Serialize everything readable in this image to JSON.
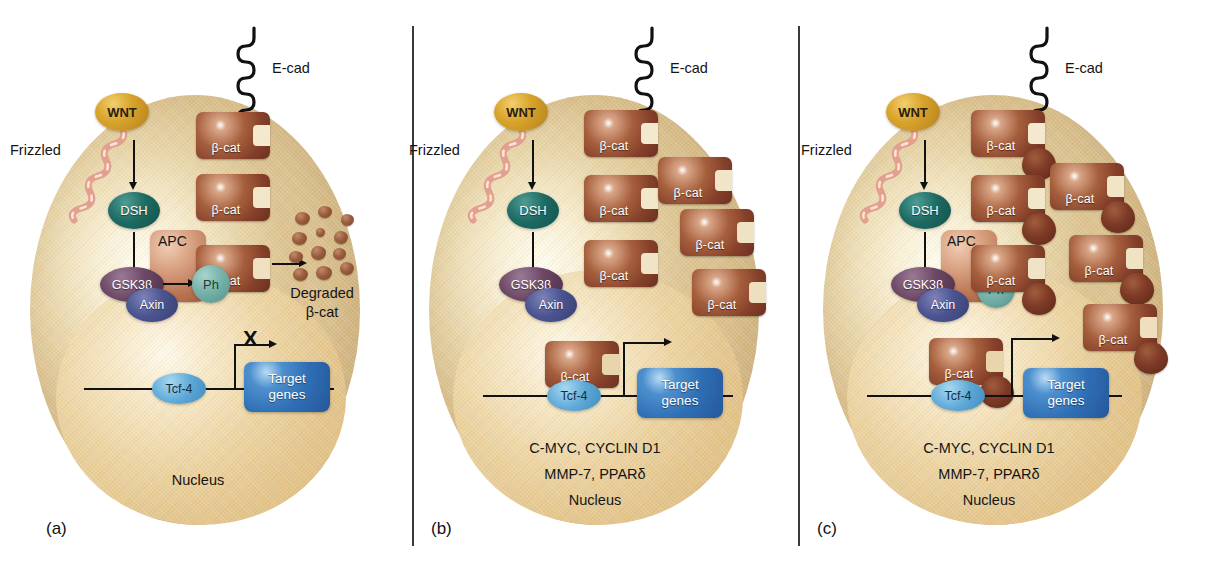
{
  "figure": {
    "panels": [
      {
        "letter": "(a)",
        "labels": {
          "ecad": "E-cad",
          "wnt": "WNT",
          "frizzled": "Frizzled",
          "dsh": "DSH",
          "apc": "APC",
          "gsk3b": "GSK3β",
          "axin": "Axin",
          "ph": "Ph",
          "bcat": "β-cat",
          "degraded_line1": "Degraded",
          "degraded_line2": "β-cat",
          "tcf4": "Tcf-4",
          "target_line1": "Target",
          "target_line2": "genes",
          "nucleus": "Nucleus",
          "blocked": "X"
        },
        "free_bcat_count": 0,
        "membrane_bcat_count": 3,
        "target_genes_active": false,
        "target_gene_list": []
      },
      {
        "letter": "(b)",
        "labels": {
          "ecad": "E-cad",
          "wnt": "WNT",
          "frizzled": "Frizzled",
          "dsh": "DSH",
          "gsk3b": "GSK3β",
          "axin": "Axin",
          "bcat": "β-cat",
          "tcf4": "Tcf-4",
          "target_line1": "Target",
          "target_line2": "genes",
          "nucleus": "Nucleus",
          "genes_line1": "C-MYC, CYCLIN D1",
          "genes_line2": "MMP-7, PPARδ"
        },
        "free_bcat_count": 6,
        "target_genes_active": true,
        "target_gene_list": [
          "C-MYC",
          "CYCLIN D1",
          "MMP-7",
          "PPARδ"
        ]
      },
      {
        "letter": "(c)",
        "labels": {
          "ecad": "E-cad",
          "wnt": "WNT",
          "frizzled": "Frizzled",
          "dsh": "DSH",
          "apc": "APC",
          "gsk3b": "GSK3β",
          "axin": "Axin",
          "ph": "Ph",
          "bcat": "β-cat",
          "tcf4": "Tcf-4",
          "target_line1": "Target",
          "target_line2": "genes",
          "nucleus": "Nucleus",
          "genes_line1": "C-MYC, CYCLIN D1",
          "genes_line2": "MMP-7, PPARδ"
        },
        "free_bcat_count": 7,
        "mutated_bcat": true,
        "target_genes_active": true,
        "target_gene_list": [
          "C-MYC",
          "CYCLIN D1",
          "MMP-7",
          "PPARδ"
        ]
      }
    ]
  },
  "colors": {
    "cytoplasm": "#eedcb4",
    "nucleus": "#e7cf9e",
    "beta_catenin": "#8e4a30",
    "beta_catenin_mutant_blob": "#6d3021",
    "wnt": "#d9a42c",
    "dsh": "#1d6b63",
    "gsk3b": "#6e4966",
    "axin": "#4b5490",
    "ph": "#76b3aa",
    "apc": "#c0825d",
    "tcf4": "#5fa9d8",
    "target_genes": "#2f6fb5",
    "frizzled": "#d98a7e",
    "ecad": "#111111",
    "background": "#ffffff"
  }
}
